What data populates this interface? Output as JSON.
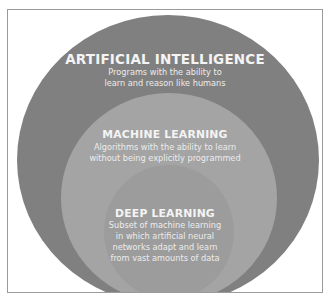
{
  "diagram": {
    "type": "nested-circles",
    "colors": {
      "background": "#ffffff",
      "border": "#9a9a9a",
      "artificial_intelligence": "#808080",
      "machine_learning": "#a4a4a4",
      "deep_learning": "#9c9c9c",
      "text": "#f4f4f4"
    },
    "layers": [
      {
        "title": "ARTIFICIAL INTELLIGENCE",
        "description_lines": [
          "Programs with the ability to",
          "learn and reason like humans"
        ]
      },
      {
        "title": "MACHINE LEARNING",
        "description_lines": [
          "Algorithms with the ability to learn",
          "without being explicitly programmed"
        ]
      },
      {
        "title": "DEEP LEARNING",
        "description_lines": [
          "Subset of machine learning",
          "in which artificial neural",
          "networks adapt and learn",
          "from vast amounts of data"
        ]
      }
    ]
  }
}
